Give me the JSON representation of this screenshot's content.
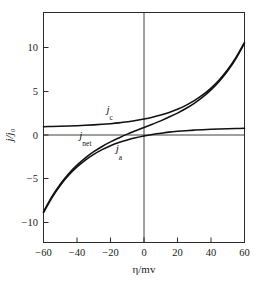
{
  "figure": {
    "title": "",
    "background_color": "#ffffff",
    "axis_color": "#2b2b2b",
    "curve_color": "#111111"
  },
  "chart_data": {
    "type": "line",
    "title": "",
    "subtitle": "",
    "xlabel": "η/mv",
    "ylabel": "j/j₀",
    "xlim": [
      -60,
      60
    ],
    "ylim": [
      -13.6,
      13.6
    ],
    "xticks": [
      -60,
      -40,
      -20,
      0,
      20,
      40,
      60
    ],
    "xtick_labels": [
      "−60",
      "−40",
      "−20",
      "0",
      "20",
      "40",
      "60"
    ],
    "yticks": [
      -10,
      -5,
      0,
      5,
      10
    ],
    "ytick_labels": [
      "−10",
      "−5",
      "0",
      "5",
      "10"
    ],
    "grid": false,
    "legend_position": "inline-annotations",
    "model": {
      "equation": "Butler-Volmer",
      "beta_mv": 26.0,
      "j_c": "exp(eta/26)",
      "j_a": "-exp(-eta/26)",
      "j_net": "2*sinh(eta/26)"
    },
    "series": [
      {
        "name": "j_c",
        "label": "j",
        "label_sub": "c",
        "label_x": -20.5,
        "label_y": 1.75,
        "x": [
          -60,
          -55,
          -50,
          -45,
          -40,
          -35,
          -30,
          -25,
          -20,
          -15,
          -10,
          -5,
          0,
          5,
          10,
          15,
          20,
          25,
          30,
          35,
          40,
          45,
          50,
          55,
          60
        ],
        "values": [
          0.0992,
          0.1199,
          0.145,
          0.1754,
          0.2121,
          0.2565,
          0.3102,
          0.3751,
          0.4536,
          0.5486,
          0.6834,
          0.8247,
          1.0,
          1.2123,
          1.4696,
          1.7817,
          2.1598,
          2.6181,
          3.1736,
          3.8469,
          4.663,
          5.6524,
          6.8518,
          8.3057,
          10.0668
        ]
      },
      {
        "name": "j_a",
        "label": "j",
        "label_sub": "a",
        "label_x": -15.0,
        "label_y": -2.95,
        "x": [
          -60,
          -55,
          -50,
          -45,
          -40,
          -35,
          -30,
          -25,
          -20,
          -15,
          -10,
          -5,
          0,
          5,
          10,
          15,
          20,
          25,
          30,
          35,
          40,
          45,
          50,
          55,
          60
        ],
        "values": [
          -10.0668,
          -8.3057,
          -6.8518,
          -5.6524,
          -4.663,
          -3.8469,
          -3.1736,
          -2.6181,
          -2.1598,
          -1.7817,
          -1.4696,
          -1.2123,
          -1.0,
          -0.8247,
          -0.6834,
          -0.5486,
          -0.4536,
          -0.3751,
          -0.3102,
          -0.2565,
          -0.2121,
          -0.1754,
          -0.145,
          -0.1199,
          -0.0992
        ]
      },
      {
        "name": "j_net",
        "label": "j",
        "label_sub": "net",
        "label_x": -35.0,
        "label_y": -1.35,
        "x": [
          -60,
          -55,
          -50,
          -45,
          -40,
          -35,
          -30,
          -25,
          -20,
          -15,
          -10,
          -5,
          0,
          5,
          10,
          15,
          20,
          25,
          30,
          35,
          40,
          45,
          50,
          55,
          60
        ],
        "values": [
          -9.9676,
          -8.1858,
          -6.7068,
          -5.477,
          -4.4509,
          -3.5904,
          -2.8634,
          -2.243,
          -1.7062,
          -1.2331,
          -0.7862,
          -0.3876,
          0.0,
          0.3876,
          0.7862,
          1.2331,
          1.7062,
          2.243,
          2.8634,
          3.5904,
          4.4509,
          5.477,
          6.7068,
          8.1858,
          9.9676
        ]
      }
    ]
  },
  "caption": {
    "cut_text": ""
  }
}
